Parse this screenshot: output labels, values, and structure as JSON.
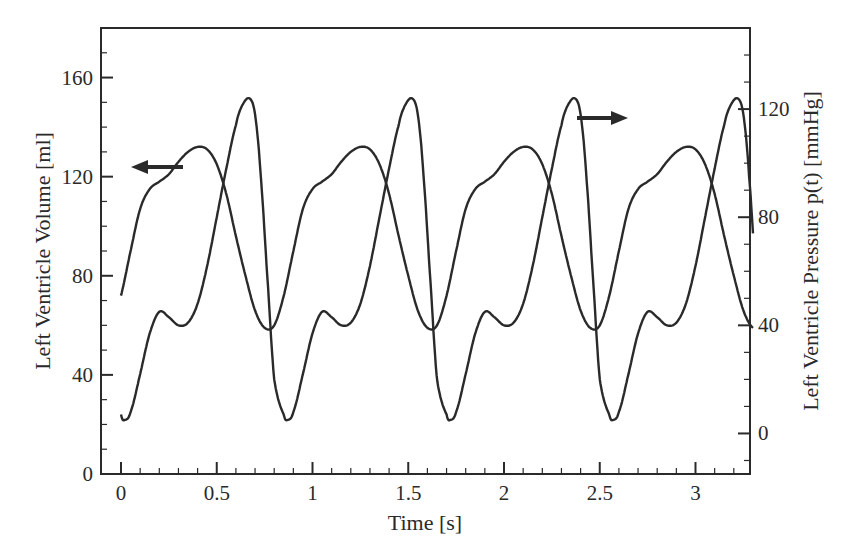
{
  "chart_data": {
    "type": "line",
    "title": "",
    "xlabel": "Time [s]",
    "ylabel_left": "Left Ventricle Volume [ml]",
    "ylabel_right": "Left Ventricle Pressure p(t) [mmHg]",
    "xlim": [
      -0.1,
      3.3
    ],
    "ylim_left": [
      0,
      180
    ],
    "ylim_right": [
      -15,
      150
    ],
    "x_ticks": [
      0,
      0.5,
      1,
      1.5,
      2,
      2.5,
      3
    ],
    "x_tick_labels": [
      "0",
      "0.5",
      "1",
      "1.5",
      "2",
      "2.5",
      "3"
    ],
    "y_left_ticks": [
      0,
      40,
      80,
      120,
      160
    ],
    "y_left_tick_labels": [
      "0",
      "40",
      "80",
      "120",
      "160"
    ],
    "y_right_ticks": [
      0,
      40,
      80,
      120
    ],
    "y_right_tick_labels": [
      "0",
      "40",
      "80",
      "120"
    ],
    "grid": false,
    "legend": "none (arrows indicate axis: left arrow on volume curve, right arrow on pressure curve)",
    "period_s": 0.85,
    "series": [
      {
        "name": "Left Ventricle Volume",
        "axis": "left",
        "unit": "ml",
        "one_cycle": {
          "t": [
            0.0,
            0.05,
            0.1,
            0.15,
            0.2,
            0.25,
            0.3,
            0.35,
            0.4,
            0.45,
            0.5,
            0.55,
            0.6,
            0.65,
            0.7,
            0.75,
            0.8,
            0.85
          ],
          "v": [
            72,
            90,
            107,
            115,
            118,
            121,
            126,
            130,
            132,
            131,
            125,
            113,
            96,
            80,
            66,
            59,
            60,
            72
          ]
        },
        "min": 59,
        "max": 132
      },
      {
        "name": "Left Ventricle Pressure p(t)",
        "axis": "right",
        "unit": "mmHg",
        "one_cycle": {
          "t": [
            0.0,
            0.02,
            0.05,
            0.1,
            0.15,
            0.2,
            0.25,
            0.3,
            0.35,
            0.4,
            0.45,
            0.5,
            0.55,
            0.6,
            0.63,
            0.67,
            0.7,
            0.73,
            0.77,
            0.8,
            0.85
          ],
          "v": [
            7,
            5,
            8,
            22,
            37,
            45,
            43,
            40,
            41,
            48,
            62,
            80,
            98,
            114,
            121,
            124,
            118,
            95,
            52,
            20,
            7
          ]
        },
        "min": 5,
        "max": 124
      }
    ],
    "annotations": [
      {
        "type": "arrow",
        "direction": "left",
        "on_series": "Left Ventricle Volume",
        "at_t": 0.2
      },
      {
        "type": "arrow",
        "direction": "right",
        "on_series": "Left Ventricle Pressure p(t)",
        "at_t": 2.45
      }
    ]
  }
}
